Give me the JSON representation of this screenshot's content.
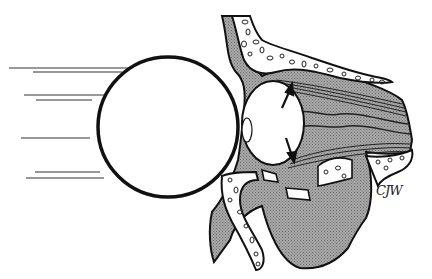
{
  "figure": {
    "elements": [
      {
        "id": "ball",
        "label": "Ball impacting the orbit"
      },
      {
        "id": "motion-lines",
        "label": "Motion lines",
        "count": 7
      },
      {
        "id": "globe",
        "label": "Eye globe"
      },
      {
        "id": "arrows",
        "label": "Pressure arrows",
        "directions": [
          "up",
          "down"
        ]
      },
      {
        "id": "orbital-roof",
        "label": "Orbital roof (frontal bone)"
      },
      {
        "id": "orbital-floor",
        "label": "Fractured orbital floor"
      },
      {
        "id": "maxillary-sinus",
        "label": "Maxillary sinus with herniated contents"
      },
      {
        "id": "optic-nerve-muscles",
        "label": "Extraocular muscles / optic nerve"
      }
    ],
    "signature": "CJW",
    "colors": {
      "line": "#111111",
      "tissue_fill": "#9a9a9a",
      "bone_fill": "#ffffff",
      "background": "#ffffff"
    }
  }
}
